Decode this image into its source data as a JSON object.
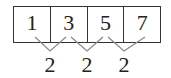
{
  "sequence": {
    "terms": [
      "1",
      "3",
      "5",
      "7"
    ],
    "differences": [
      "2",
      "2",
      "2"
    ]
  },
  "colors": {
    "border": "#333333",
    "connector": "#888888",
    "text": "#222222"
  }
}
